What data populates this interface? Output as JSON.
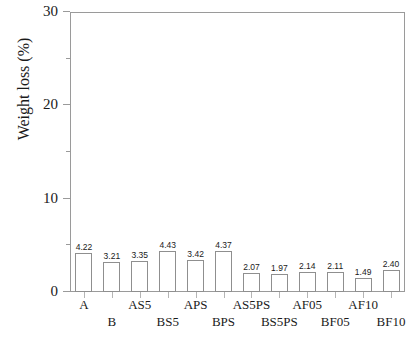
{
  "chart_data": {
    "type": "bar",
    "title": "",
    "xlabel": "",
    "ylabel": "Weight loss (%)",
    "ylim": [
      0,
      30
    ],
    "yticks": [
      0,
      10,
      20,
      30
    ],
    "yticks_minor": [
      5,
      15,
      25
    ],
    "grid": false,
    "legend": "none",
    "categories": [
      "A",
      "B",
      "AS5",
      "BS5",
      "APS",
      "BPS",
      "AS5PS",
      "BS5PS",
      "AF05",
      "BF05",
      "AF10",
      "BF10"
    ],
    "values": [
      4.22,
      3.21,
      3.35,
      4.43,
      3.42,
      4.37,
      2.07,
      1.97,
      2.14,
      2.11,
      1.49,
      2.4
    ],
    "value_labels": [
      "4.22",
      "3.21",
      "3.35",
      "4.43",
      "3.42",
      "4.37",
      "2.07",
      "1.97",
      "2.14",
      "2.11",
      "1.49",
      "2.40"
    ],
    "label_rows": [
      0,
      1,
      0,
      1,
      0,
      1,
      0,
      1,
      0,
      1,
      0,
      1
    ],
    "bar_face_color": "#ffffff",
    "bar_edge_color": "#8f8f8f",
    "axis_color": "#9a9a9a",
    "text_color": "#1a1a1a"
  },
  "axis": {
    "ytick_labels": [
      "0",
      "10",
      "20",
      "30"
    ]
  }
}
